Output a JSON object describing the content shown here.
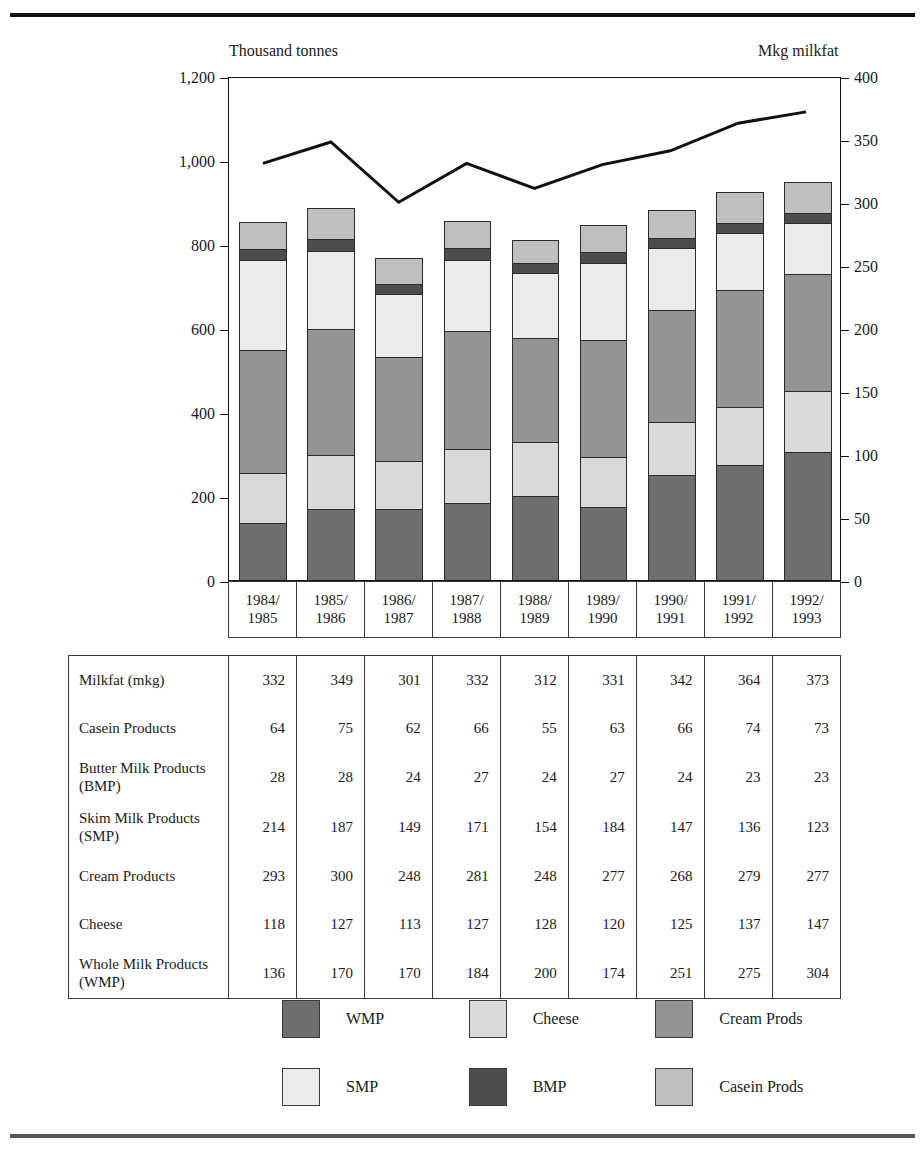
{
  "axis_captions": {
    "left": "Thousand tonnes",
    "right": "Mkg milkfat"
  },
  "chart_data": {
    "type": "bar",
    "subtype": "stacked-bar-with-line",
    "title": "",
    "xlabel": "",
    "ylabel": "Thousand tonnes",
    "y2label": "Mkg milkfat",
    "ylim": [
      0,
      1200
    ],
    "y2lim": [
      0,
      400
    ],
    "grid": false,
    "legend_position": "bottom",
    "categories": [
      "1984/1985",
      "1985/1986",
      "1986/1987",
      "1987/1988",
      "1988/1989",
      "1989/1990",
      "1990/1991",
      "1991/1992",
      "1992/1993"
    ],
    "category_lines": [
      [
        "1984/",
        "1985"
      ],
      [
        "1985/",
        "1986"
      ],
      [
        "1986/",
        "1987"
      ],
      [
        "1987/",
        "1988"
      ],
      [
        "1988/",
        "1989"
      ],
      [
        "1989/",
        "1990"
      ],
      [
        "1990/",
        "1991"
      ],
      [
        "1991/",
        "1992"
      ],
      [
        "1992/",
        "1993"
      ]
    ],
    "yticks": [
      0,
      200,
      400,
      600,
      800,
      1000,
      1200
    ],
    "ytick_labels": [
      "0",
      "200",
      "400",
      "600",
      "800",
      "1,000",
      "1,200"
    ],
    "y2ticks": [
      0,
      50,
      100,
      150,
      200,
      250,
      300,
      350,
      400
    ],
    "y2tick_labels": [
      "0",
      "50",
      "100",
      "150",
      "200",
      "250",
      "300",
      "350",
      "400"
    ],
    "stack_order_bottom_to_top": [
      "WMP",
      "Cheese",
      "Cream Prods",
      "SMP",
      "BMP",
      "Casein Prods"
    ],
    "series": [
      {
        "name": "WMP",
        "axis": "left",
        "values": [
          136,
          170,
          170,
          184,
          200,
          174,
          251,
          275,
          304
        ],
        "color": "#6e6e6e"
      },
      {
        "name": "Cheese",
        "axis": "left",
        "values": [
          118,
          127,
          113,
          127,
          128,
          120,
          125,
          137,
          147
        ],
        "color": "#d9d9d9"
      },
      {
        "name": "Cream Prods",
        "axis": "left",
        "values": [
          293,
          300,
          248,
          281,
          248,
          277,
          268,
          279,
          277
        ],
        "color": "#949494"
      },
      {
        "name": "SMP",
        "axis": "left",
        "values": [
          214,
          187,
          149,
          171,
          154,
          184,
          147,
          136,
          123
        ],
        "color": "#ececec"
      },
      {
        "name": "BMP",
        "axis": "left",
        "values": [
          28,
          28,
          24,
          27,
          24,
          27,
          24,
          23,
          23
        ],
        "color": "#4d4d4d"
      },
      {
        "name": "Casein Prods",
        "axis": "left",
        "values": [
          64,
          75,
          62,
          66,
          55,
          63,
          66,
          74,
          73
        ],
        "color": "#bfbfbf"
      },
      {
        "name": "Milkfat (mkg)",
        "axis": "right",
        "values": [
          332,
          349,
          301,
          332,
          312,
          331,
          342,
          364,
          373
        ],
        "color": "#111111",
        "render": "line"
      }
    ],
    "totals": [
      853,
      887,
      766,
      856,
      809,
      845,
      881,
      924,
      947
    ]
  },
  "table": {
    "row_labels": [
      "Milkfat (mkg)",
      "Casein Products",
      "Butter Milk Products\n(BMP)",
      "Skim Milk Products\n(SMP)",
      "Cream Products",
      "Cheese",
      "Whole Milk Products\n(WMP)"
    ],
    "rows": [
      {
        "label_line1": "Milkfat (mkg)",
        "label_line2": "",
        "values": [
          332,
          349,
          301,
          332,
          312,
          331,
          342,
          364,
          373
        ]
      },
      {
        "label_line1": "Casein Products",
        "label_line2": "",
        "values": [
          64,
          75,
          62,
          66,
          55,
          63,
          66,
          74,
          73
        ]
      },
      {
        "label_line1": "Butter Milk Products",
        "label_line2": "(BMP)",
        "values": [
          28,
          28,
          24,
          27,
          24,
          27,
          24,
          23,
          23
        ]
      },
      {
        "label_line1": "Skim Milk Products",
        "label_line2": "(SMP)",
        "values": [
          214,
          187,
          149,
          171,
          154,
          184,
          147,
          136,
          123
        ]
      },
      {
        "label_line1": "Cream Products",
        "label_line2": "",
        "values": [
          293,
          300,
          248,
          281,
          248,
          277,
          268,
          279,
          277
        ]
      },
      {
        "label_line1": "Cheese",
        "label_line2": "",
        "values": [
          118,
          127,
          113,
          127,
          128,
          120,
          125,
          137,
          147
        ]
      },
      {
        "label_line1": "Whole Milk Products",
        "label_line2": "(WMP)",
        "values": [
          136,
          170,
          170,
          184,
          200,
          174,
          251,
          275,
          304
        ]
      }
    ]
  },
  "legend": {
    "items": [
      {
        "label": "WMP",
        "color": "#6e6e6e"
      },
      {
        "label": "Cheese",
        "color": "#d9d9d9"
      },
      {
        "label": "Cream Prods",
        "color": "#949494"
      },
      {
        "label": "SMP",
        "color": "#ececec"
      },
      {
        "label": "BMP",
        "color": "#4d4d4d"
      },
      {
        "label": "Casein Prods",
        "color": "#bfbfbf"
      }
    ]
  }
}
